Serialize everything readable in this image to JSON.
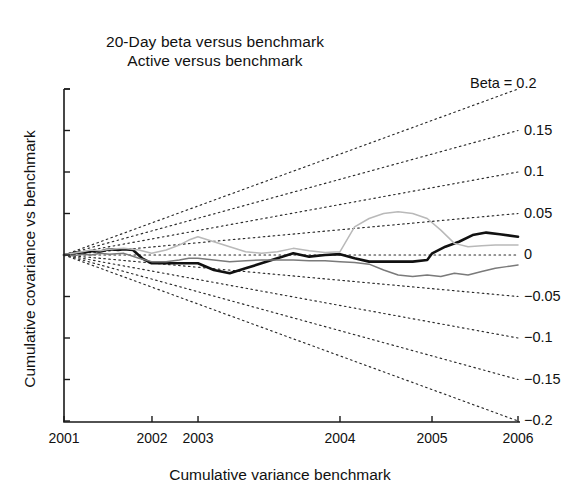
{
  "title": {
    "line1": "20-Day beta versus benchmark",
    "line2": "Active versus benchmark"
  },
  "axes": {
    "xlabel": "Cumulative variance benchmark",
    "ylabel": "Cumulative covariance vs benchmark"
  },
  "chart_data": {
    "type": "line",
    "xlabel": "Cumulative variance benchmark",
    "ylabel": "Cumulative covariance vs benchmark",
    "grid": false,
    "legend": "none",
    "ylim": [
      -0.2,
      0.2
    ],
    "xlim": [
      0,
      1
    ],
    "xtick_labels": [
      "2001",
      "2002",
      "2003",
      "2004",
      "2005",
      "2006"
    ],
    "xtick_positions": [
      0.0,
      0.1938,
      0.2952,
      0.6079,
      0.8106,
      1.0
    ],
    "ytick_values": [
      0.2,
      0.15,
      0.1,
      0.05,
      0,
      -0.05,
      -0.1,
      -0.15,
      -0.2
    ],
    "beta_fan": {
      "note": "dotted rays radiating from origin; slope equals beta",
      "prefix_label": "Beta = ",
      "labels": [
        "Beta = 0.2",
        "0.15",
        "0.1",
        "0.05",
        "0",
        "−0.05",
        "−0.1",
        "−0.15",
        "−0.2"
      ],
      "values": [
        0.2,
        0.15,
        0.1,
        0.05,
        0,
        -0.05,
        -0.1,
        -0.15,
        -0.2
      ]
    },
    "series": [
      {
        "name": "active-black",
        "style": "solid-thick-black",
        "color": "#111111",
        "x": [
          0.0,
          0.013,
          0.026,
          0.04,
          0.053,
          0.066,
          0.079,
          0.092,
          0.106,
          0.119,
          0.132,
          0.152,
          0.172,
          0.193,
          0.213,
          0.234,
          0.254,
          0.275,
          0.295,
          0.33,
          0.365,
          0.4,
          0.435,
          0.47,
          0.505,
          0.54,
          0.575,
          0.608,
          0.64,
          0.672,
          0.704,
          0.736,
          0.768,
          0.8,
          0.811,
          0.84,
          0.87,
          0.9,
          0.93,
          0.96,
          1.0
        ],
        "y": [
          0.0,
          0.001,
          0.003,
          0.002,
          0.004,
          0.005,
          0.004,
          0.006,
          0.007,
          0.006,
          0.007,
          0.006,
          -0.004,
          -0.01,
          -0.01,
          -0.01,
          -0.01,
          -0.01,
          -0.01,
          -0.018,
          -0.022,
          -0.016,
          -0.01,
          -0.004,
          0.002,
          -0.002,
          0.0,
          0.001,
          -0.004,
          -0.008,
          -0.008,
          -0.008,
          -0.008,
          -0.006,
          0.002,
          0.01,
          0.016,
          0.024,
          0.027,
          0.025,
          0.022
        ]
      },
      {
        "name": "active-light-gray",
        "style": "solid-thin-lightgray",
        "color": "#b9b9b9",
        "x": [
          0.0,
          0.02,
          0.04,
          0.06,
          0.08,
          0.1,
          0.132,
          0.165,
          0.193,
          0.225,
          0.254,
          0.275,
          0.295,
          0.33,
          0.365,
          0.4,
          0.435,
          0.47,
          0.505,
          0.54,
          0.575,
          0.608,
          0.64,
          0.672,
          0.704,
          0.736,
          0.768,
          0.8,
          0.83,
          0.86,
          0.89,
          0.92,
          0.95,
          0.975,
          1.0
        ],
        "y": [
          0.0,
          0.002,
          0.004,
          0.006,
          0.005,
          0.007,
          0.008,
          0.006,
          0.002,
          0.006,
          0.012,
          0.018,
          0.022,
          0.016,
          0.01,
          0.004,
          0.002,
          0.004,
          0.008,
          0.005,
          0.003,
          0.004,
          0.034,
          0.044,
          0.05,
          0.052,
          0.05,
          0.044,
          0.03,
          0.014,
          0.01,
          0.011,
          0.012,
          0.012,
          0.012
        ]
      },
      {
        "name": "active-mid-gray",
        "style": "solid-thin-midgray",
        "color": "#7a7a7a",
        "x": [
          0.0,
          0.02,
          0.04,
          0.06,
          0.08,
          0.1,
          0.132,
          0.165,
          0.193,
          0.225,
          0.254,
          0.275,
          0.295,
          0.33,
          0.365,
          0.4,
          0.435,
          0.47,
          0.505,
          0.54,
          0.575,
          0.608,
          0.64,
          0.672,
          0.704,
          0.736,
          0.768,
          0.8,
          0.83,
          0.86,
          0.89,
          0.92,
          0.95,
          0.975,
          1.0
        ],
        "y": [
          0.0,
          -0.001,
          0.001,
          0.0,
          0.002,
          0.001,
          0.002,
          -0.004,
          -0.008,
          -0.008,
          -0.006,
          -0.004,
          -0.004,
          -0.006,
          -0.008,
          -0.007,
          -0.006,
          -0.006,
          -0.006,
          -0.007,
          -0.007,
          -0.008,
          -0.009,
          -0.011,
          -0.018,
          -0.024,
          -0.026,
          -0.024,
          -0.026,
          -0.022,
          -0.024,
          -0.02,
          -0.016,
          -0.014,
          -0.012
        ]
      }
    ]
  }
}
